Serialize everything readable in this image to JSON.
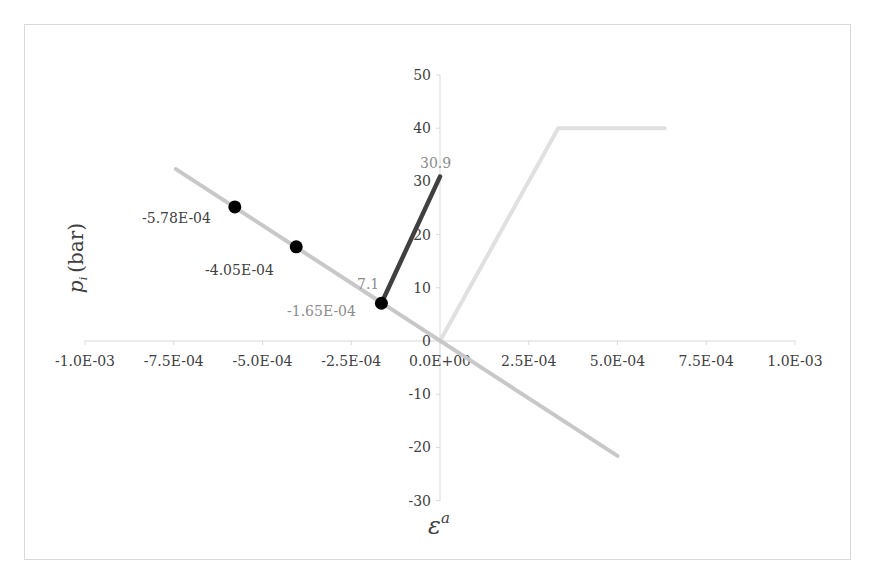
{
  "chart_data": {
    "type": "line",
    "title": "",
    "xlabel": "ε^a",
    "ylabel": "p_i (bar)",
    "xlim": [
      -0.001,
      0.001
    ],
    "ylim": [
      -30,
      50
    ],
    "grid": false,
    "legend": null,
    "x_ticks": [
      "-1.0E-03",
      "-7.5E-04",
      "-5.0E-04",
      "-2.5E-04",
      "0.0E+00",
      "2.5E-04",
      "5.0E-04",
      "7.5E-04",
      "1.0E-03"
    ],
    "y_ticks": [
      "50",
      "40",
      "30",
      "20",
      "10",
      "0",
      "-10",
      "-20",
      "-30"
    ],
    "series": [
      {
        "name": "decreasing-line",
        "color": "#c8c8c8",
        "x": [
          -0.000744,
          0.0005
        ],
        "y": [
          32.3,
          -21.6
        ]
      },
      {
        "name": "marked-points",
        "color": "#000000",
        "marker": "circle",
        "x": [
          -0.000578,
          -0.000405,
          -0.000165
        ],
        "y": [
          25.2,
          17.7,
          7.1
        ],
        "labels": [
          "-5.78E-04",
          "-4.05E-04",
          "-1.65E-04"
        ]
      },
      {
        "name": "dark-segment",
        "color": "#404040",
        "x": [
          -0.000165,
          0.0
        ],
        "y": [
          7.1,
          30.9
        ],
        "labels": [
          "7.1",
          "30.9"
        ]
      },
      {
        "name": "light-bilinear",
        "color": "#e0e0e0",
        "x": [
          0.0,
          0.000333,
          0.000633
        ],
        "y": [
          0,
          40,
          40
        ]
      }
    ]
  },
  "labels": {
    "ylabel_var": "p",
    "ylabel_sub": "i",
    "ylabel_unit": "(bar)",
    "xlabel_var": "ε",
    "xlabel_sup": "a",
    "point1": "-5.78E-04",
    "point2": "-4.05E-04",
    "point3": "-1.65E-04",
    "dark_start": "7.1",
    "dark_end": "30.9"
  }
}
